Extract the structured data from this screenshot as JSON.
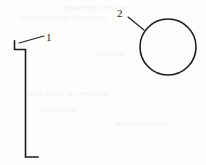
{
  "figure": {
    "type": "technical-line-drawing",
    "style": "patent-figure",
    "width": 206,
    "height": 165,
    "background_color": "#fdfdfc",
    "line_color": "#1c1c1c",
    "ghost_color": "#f2f1ef"
  },
  "callouts": [
    {
      "label": "1",
      "label_x": 46,
      "label_y": 32,
      "refers_to": "bracket-profile",
      "leader": {
        "x1": 44,
        "y1": 36,
        "x2": 19,
        "y2": 43
      }
    },
    {
      "label": "2",
      "label_x": 117,
      "label_y": 8,
      "refers_to": "circle-profile",
      "leader": {
        "x1": 128,
        "y1": 17,
        "x2": 144,
        "y2": 30
      }
    }
  ],
  "shapes": {
    "bracket": {
      "name": "bracket-profile",
      "stroke_width": 1.6,
      "points": "14.5,41 14.5,49.5 25.5,49.5 25.5,157 38,157"
    },
    "circle": {
      "name": "circle-profile",
      "stroke_width": 1.6,
      "cx": 168,
      "cy": 47,
      "r": 28
    }
  },
  "ghost_text": [
    {
      "text": "диаметр детали",
      "x": 62,
      "y": 2
    },
    {
      "text": "соединения профиль",
      "x": 20,
      "y": 12
    },
    {
      "text": "поверх",
      "x": 96,
      "y": 48
    },
    {
      "text": "при этом в сечении",
      "x": 28,
      "y": 88
    },
    {
      "text": "толщина",
      "x": 40,
      "y": 104
    },
    {
      "text": "конструкции",
      "x": 116,
      "y": 118
    }
  ]
}
